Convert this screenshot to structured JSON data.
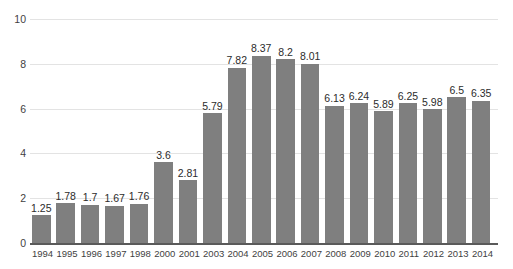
{
  "chart_data": {
    "type": "bar",
    "title": "",
    "subtitle": "",
    "xlabel": "",
    "ylabel": "",
    "ylim": [
      0,
      10
    ],
    "yticks": [
      0,
      2,
      4,
      6,
      8,
      10
    ],
    "grid": true,
    "legend": false,
    "legend_position": "none",
    "bar_color": "#7f7f7f",
    "gridline_color": "#e3e3e3",
    "axis_color": "#5a5a5a",
    "background_color": "#ffffff",
    "data_labels_shown": true,
    "categories": [
      "1994",
      "1995",
      "1996",
      "1997",
      "1998",
      "2000",
      "2001",
      "2003",
      "2004",
      "2005",
      "2006",
      "2007",
      "2008",
      "2009",
      "2010",
      "2011",
      "2012",
      "2013",
      "2014"
    ],
    "values": [
      1.25,
      1.78,
      1.7,
      1.67,
      1.76,
      3.6,
      2.81,
      5.79,
      7.82,
      8.37,
      8.2,
      8.01,
      6.13,
      6.24,
      5.89,
      6.25,
      5.98,
      6.5,
      6.35
    ],
    "value_labels": [
      "1.25",
      "1.78",
      "1.7",
      "1.67",
      "1.76",
      "3.6",
      "2.81",
      "5.79",
      "7.82",
      "8.37",
      "8.2",
      "8.01",
      "6.13",
      "6.24",
      "5.89",
      "6.25",
      "5.98",
      "6.5",
      "6.35"
    ],
    "ytick_labels": [
      "0",
      "2",
      "4",
      "6",
      "8",
      "10"
    ]
  }
}
